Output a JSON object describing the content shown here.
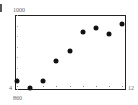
{
  "chart_data": {
    "type": "scatter",
    "title": "",
    "panel_label": "",
    "xlabel": "",
    "ylabel": "",
    "x_range_labels": {
      "min": "4",
      "max": "12"
    },
    "y_range_labels": {
      "min": "860",
      "max": "1000"
    },
    "xlim": [
      4,
      12
    ],
    "ylim": [
      860,
      1000
    ],
    "grid": false,
    "legend": null,
    "points": [
      {
        "x": 4,
        "y": 876
      },
      {
        "x": 5,
        "y": 862
      },
      {
        "x": 6,
        "y": 876
      },
      {
        "x": 7,
        "y": 913
      },
      {
        "x": 8,
        "y": 932
      },
      {
        "x": 9,
        "y": 967
      },
      {
        "x": 10,
        "y": 975
      },
      {
        "x": 11,
        "y": 965
      },
      {
        "x": 12,
        "y": 983
      }
    ]
  },
  "labels": {
    "ymax": "1000",
    "ymin": "860",
    "xmin": "4",
    "xmax": "12"
  }
}
